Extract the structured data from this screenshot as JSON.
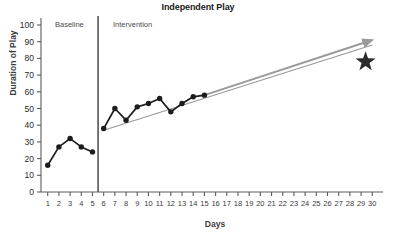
{
  "chart_data": {
    "type": "line",
    "title": "Independent Play",
    "xlabel": "Days",
    "ylabel": "Duration of Play",
    "xlim": [
      0.4,
      30.6
    ],
    "ylim": [
      0,
      100
    ],
    "grid": false,
    "legend": "none",
    "y_ticks": [
      0,
      10,
      20,
      30,
      40,
      50,
      60,
      70,
      80,
      90,
      100
    ],
    "x_ticks": [
      1,
      2,
      3,
      4,
      5,
      6,
      7,
      8,
      9,
      10,
      11,
      12,
      13,
      14,
      15,
      16,
      17,
      18,
      19,
      20,
      21,
      22,
      23,
      24,
      25,
      26,
      27,
      28,
      29,
      30
    ],
    "phases": [
      {
        "name": "Baseline",
        "x_start": 1,
        "x_end": 5
      },
      {
        "name": "Intervention",
        "x_start": 6,
        "x_end": 30
      }
    ],
    "phase_divider_x": 5.5,
    "series": [
      {
        "name": "Baseline",
        "marker": "filled-circle",
        "color": "#1c1c1c",
        "x": [
          1,
          2,
          3,
          4,
          5
        ],
        "values": [
          16,
          27,
          32,
          27,
          24
        ]
      },
      {
        "name": "Intervention",
        "marker": "filled-circle",
        "color": "#1c1c1c",
        "x": [
          6,
          7,
          8,
          9,
          10,
          11,
          12,
          13,
          14,
          15
        ],
        "values": [
          38,
          50,
          43,
          51,
          53,
          56,
          48,
          53,
          57,
          58
        ]
      }
    ],
    "trend_line": {
      "name": "trend",
      "color": "#9a9a9a",
      "x_start": 6,
      "y_start": 37,
      "x_end": 30,
      "y_end": 88
    },
    "projection_arrow": {
      "name": "projection-arrow",
      "color": "#9a9a9a",
      "x_start": 15,
      "y_start": 58,
      "x_end": 30,
      "y_end": 91,
      "arrowhead": true
    },
    "goal_marker": {
      "name": "goal-star",
      "symbol": "star",
      "color": "#2b2b2b",
      "x": 29.4,
      "y": 78
    }
  },
  "colors": {
    "axis": "#5c5c5c",
    "data": "#1c1c1c",
    "trend": "#9a9a9a",
    "divider": "#555555",
    "text": "#2b2b2b",
    "background": "#ffffff"
  }
}
